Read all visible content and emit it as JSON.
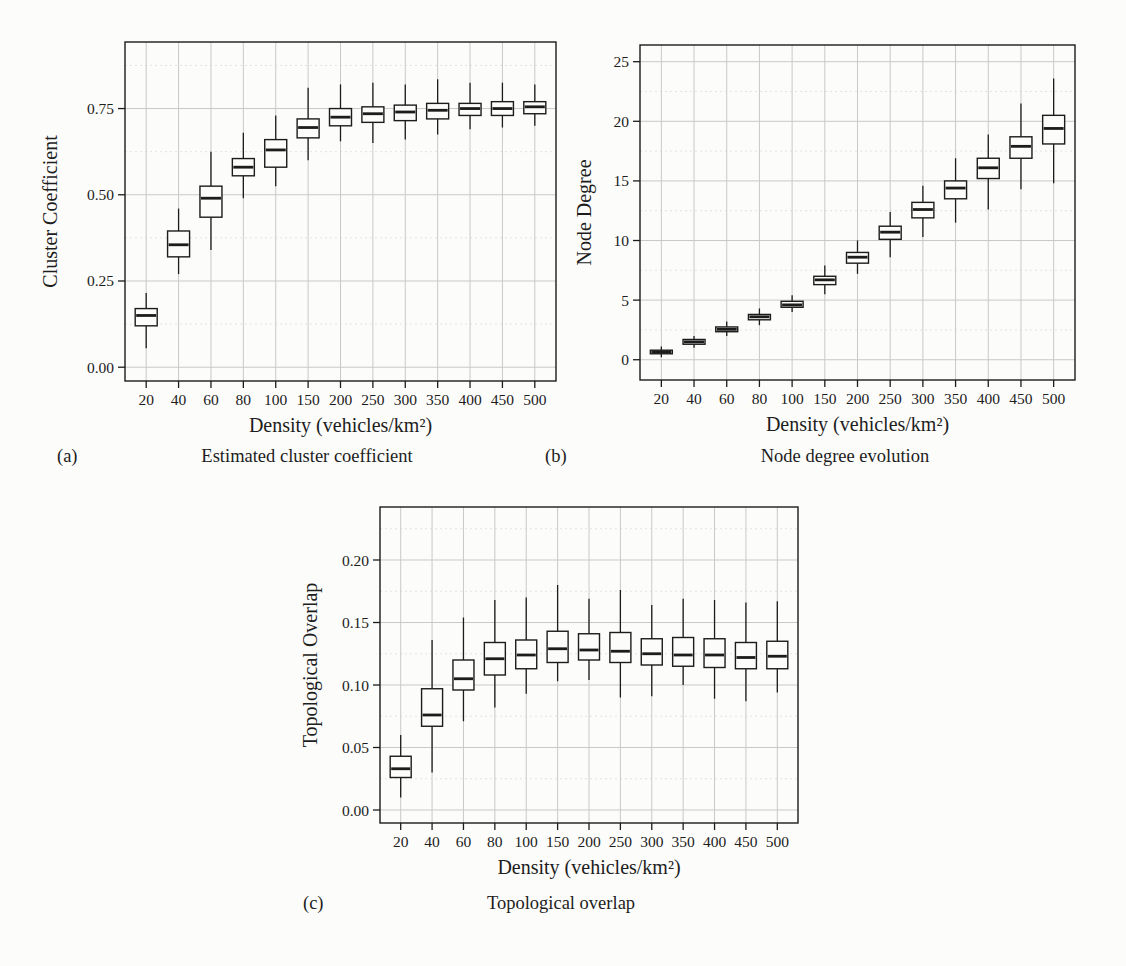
{
  "colors": {
    "ink": "#1c1c1c",
    "grid_major": "#c9c9c9",
    "grid_minor": "#e3e3e3",
    "background": "#fcfcfa"
  },
  "figures": [
    {
      "label": "(a)",
      "caption": "Estimated cluster coefficient"
    },
    {
      "label": "(b)",
      "caption": "Node degree evolution"
    },
    {
      "label": "(c)",
      "caption": "Topological overlap"
    }
  ],
  "chart_data": [
    {
      "id": "a",
      "type": "boxplot",
      "title": "Estimated cluster coefficient",
      "xlabel": "Density (vehicles/km²)",
      "ylabel": "Cluster Coefficient",
      "categories": [
        "20",
        "40",
        "60",
        "80",
        "100",
        "150",
        "200",
        "250",
        "300",
        "350",
        "400",
        "450",
        "500"
      ],
      "yticks": [
        0,
        0.25,
        0.5,
        0.75
      ],
      "ytick_labels": [
        "0.00",
        "0.25",
        "0.50",
        "0.75"
      ],
      "ylim": [
        -0.04,
        0.943
      ],
      "grid": true,
      "boxes": [
        {
          "low": 0.055,
          "q1": 0.12,
          "median": 0.15,
          "q3": 0.17,
          "high": 0.215
        },
        {
          "low": 0.27,
          "q1": 0.32,
          "median": 0.355,
          "q3": 0.395,
          "high": 0.46
        },
        {
          "low": 0.34,
          "q1": 0.435,
          "median": 0.49,
          "q3": 0.525,
          "high": 0.625
        },
        {
          "low": 0.49,
          "q1": 0.555,
          "median": 0.58,
          "q3": 0.605,
          "high": 0.68
        },
        {
          "low": 0.525,
          "q1": 0.58,
          "median": 0.63,
          "q3": 0.66,
          "high": 0.73
        },
        {
          "low": 0.6,
          "q1": 0.665,
          "median": 0.695,
          "q3": 0.72,
          "high": 0.81
        },
        {
          "low": 0.655,
          "q1": 0.7,
          "median": 0.725,
          "q3": 0.75,
          "high": 0.82
        },
        {
          "low": 0.65,
          "q1": 0.71,
          "median": 0.735,
          "q3": 0.755,
          "high": 0.825
        },
        {
          "low": 0.66,
          "q1": 0.715,
          "median": 0.74,
          "q3": 0.76,
          "high": 0.82
        },
        {
          "low": 0.675,
          "q1": 0.72,
          "median": 0.745,
          "q3": 0.765,
          "high": 0.835
        },
        {
          "low": 0.69,
          "q1": 0.73,
          "median": 0.75,
          "q3": 0.765,
          "high": 0.825
        },
        {
          "low": 0.695,
          "q1": 0.73,
          "median": 0.75,
          "q3": 0.77,
          "high": 0.825
        },
        {
          "low": 0.7,
          "q1": 0.735,
          "median": 0.755,
          "q3": 0.77,
          "high": 0.82
        }
      ]
    },
    {
      "id": "b",
      "type": "boxplot",
      "title": "Node degree evolution",
      "xlabel": "Density (vehicles/km²)",
      "ylabel": "Node Degree",
      "categories": [
        "20",
        "40",
        "60",
        "80",
        "100",
        "150",
        "200",
        "250",
        "300",
        "350",
        "400",
        "450",
        "500"
      ],
      "yticks": [
        0,
        5,
        10,
        15,
        20,
        25
      ],
      "ytick_labels": [
        "0",
        "5",
        "10",
        "15",
        "20",
        "25"
      ],
      "ylim": [
        -1.7,
        26.4
      ],
      "grid": true,
      "boxes": [
        {
          "low": 0.2,
          "q1": 0.5,
          "median": 0.65,
          "q3": 0.8,
          "high": 1.1
        },
        {
          "low": 1.0,
          "q1": 1.3,
          "median": 1.5,
          "q3": 1.7,
          "high": 2.0
        },
        {
          "low": 2.0,
          "q1": 2.35,
          "median": 2.55,
          "q3": 2.75,
          "high": 3.2
        },
        {
          "low": 2.9,
          "q1": 3.35,
          "median": 3.6,
          "q3": 3.8,
          "high": 4.3
        },
        {
          "low": 4.0,
          "q1": 4.4,
          "median": 4.6,
          "q3": 4.9,
          "high": 5.4
        },
        {
          "low": 5.5,
          "q1": 6.3,
          "median": 6.7,
          "q3": 7.0,
          "high": 7.9
        },
        {
          "low": 7.2,
          "q1": 8.1,
          "median": 8.6,
          "q3": 9.0,
          "high": 10.0
        },
        {
          "low": 8.6,
          "q1": 10.1,
          "median": 10.7,
          "q3": 11.2,
          "high": 12.4
        },
        {
          "low": 10.3,
          "q1": 11.9,
          "median": 12.6,
          "q3": 13.2,
          "high": 14.6
        },
        {
          "low": 11.5,
          "q1": 13.5,
          "median": 14.4,
          "q3": 15.0,
          "high": 16.9
        },
        {
          "low": 12.6,
          "q1": 15.2,
          "median": 16.1,
          "q3": 16.9,
          "high": 18.9
        },
        {
          "low": 14.3,
          "q1": 16.9,
          "median": 17.9,
          "q3": 18.7,
          "high": 21.5
        },
        {
          "low": 14.8,
          "q1": 18.1,
          "median": 19.4,
          "q3": 20.5,
          "high": 23.6
        }
      ]
    },
    {
      "id": "c",
      "type": "boxplot",
      "title": "Topological overlap",
      "xlabel": "Density (vehicles/km²)",
      "ylabel": "Topological Overlap",
      "categories": [
        "20",
        "40",
        "60",
        "80",
        "100",
        "150",
        "200",
        "250",
        "300",
        "350",
        "400",
        "450",
        "500"
      ],
      "yticks": [
        0,
        0.05,
        0.1,
        0.15,
        0.2
      ],
      "ytick_labels": [
        "0.00",
        "0.05",
        "0.10",
        "0.15",
        "0.20"
      ],
      "ylim": [
        -0.0104,
        0.2424
      ],
      "grid": true,
      "boxes": [
        {
          "low": 0.01,
          "q1": 0.026,
          "median": 0.033,
          "q3": 0.043,
          "high": 0.06
        },
        {
          "low": 0.03,
          "q1": 0.067,
          "median": 0.076,
          "q3": 0.097,
          "high": 0.136
        },
        {
          "low": 0.071,
          "q1": 0.096,
          "median": 0.105,
          "q3": 0.12,
          "high": 0.154
        },
        {
          "low": 0.082,
          "q1": 0.108,
          "median": 0.121,
          "q3": 0.134,
          "high": 0.168
        },
        {
          "low": 0.093,
          "q1": 0.113,
          "median": 0.124,
          "q3": 0.136,
          "high": 0.17
        },
        {
          "low": 0.103,
          "q1": 0.118,
          "median": 0.129,
          "q3": 0.143,
          "high": 0.18
        },
        {
          "low": 0.104,
          "q1": 0.12,
          "median": 0.128,
          "q3": 0.141,
          "high": 0.169
        },
        {
          "low": 0.09,
          "q1": 0.118,
          "median": 0.127,
          "q3": 0.142,
          "high": 0.176
        },
        {
          "low": 0.091,
          "q1": 0.116,
          "median": 0.125,
          "q3": 0.137,
          "high": 0.164
        },
        {
          "low": 0.1,
          "q1": 0.115,
          "median": 0.124,
          "q3": 0.138,
          "high": 0.169
        },
        {
          "low": 0.089,
          "q1": 0.114,
          "median": 0.124,
          "q3": 0.137,
          "high": 0.168
        },
        {
          "low": 0.087,
          "q1": 0.113,
          "median": 0.122,
          "q3": 0.134,
          "high": 0.166
        },
        {
          "low": 0.094,
          "q1": 0.113,
          "median": 0.123,
          "q3": 0.135,
          "high": 0.167
        }
      ]
    }
  ]
}
